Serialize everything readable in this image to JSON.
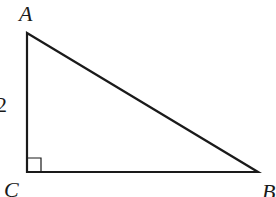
{
  "diagram": {
    "type": "right-triangle",
    "vertices": {
      "A": {
        "label": "A",
        "x": 27,
        "y": 33
      },
      "C": {
        "label": "C",
        "x": 27,
        "y": 172
      },
      "B": {
        "label": "B",
        "x": 258,
        "y": 172
      }
    },
    "right_angle_at": "C",
    "side_labels": {
      "AC": "2"
    },
    "colors": {
      "stroke": "#1a1a1a",
      "background": "#ffffff"
    }
  }
}
